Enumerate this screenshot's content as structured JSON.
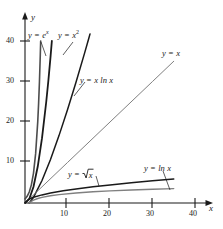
{
  "chart_data": {
    "type": "line",
    "title": "",
    "xlabel": "x",
    "ylabel": "y",
    "xlim": [
      0,
      43
    ],
    "ylim": [
      0,
      45
    ],
    "grid": false,
    "legend_position": "inline-annotations",
    "x_ticks": [
      10,
      20,
      30,
      40
    ],
    "y_ticks": [
      10,
      20,
      30,
      40
    ],
    "x_tick_labels": [
      "10",
      "20",
      "30",
      "40"
    ],
    "y_tick_labels": [
      "10",
      "20",
      "30",
      "40"
    ],
    "series": [
      {
        "name": "y = e^x",
        "label": "y = e",
        "label_sup": "x",
        "expression": "exp(x)",
        "color": "#4d4d4d",
        "width": 1.6,
        "x": [
          0,
          0.5,
          1,
          1.5,
          2,
          2.5,
          3,
          3.2,
          3.4,
          3.6,
          3.689
        ],
        "values": [
          1,
          1.65,
          2.72,
          4.48,
          7.39,
          12.18,
          20.09,
          24.53,
          29.96,
          36.6,
          40
        ]
      },
      {
        "name": "y = x^2",
        "label": "y = x",
        "label_sup": "2",
        "expression": "x*x",
        "color": "#1a1a1a",
        "width": 1.8,
        "x": [
          0,
          1,
          2,
          3,
          4,
          5,
          5.5,
          6,
          6.32
        ],
        "values": [
          0,
          1,
          4,
          9,
          16,
          25,
          30.25,
          36,
          40
        ]
      },
      {
        "name": "y = x ln x",
        "label": "y = x ln x",
        "expression": "x*ln(x)",
        "color": "#1a1a1a",
        "width": 1.5,
        "x": [
          1,
          2,
          4,
          6,
          8,
          10,
          12,
          14,
          15,
          15.3
        ],
        "values": [
          0,
          1.39,
          5.55,
          10.75,
          16.64,
          23.03,
          29.82,
          36.94,
          40.62,
          41.75
        ]
      },
      {
        "name": "y = x",
        "label": "y = x",
        "expression": "x",
        "color": "#808080",
        "width": 1.0,
        "x": [
          0,
          10,
          20,
          30,
          35
        ],
        "values": [
          0,
          10,
          20,
          30,
          35
        ]
      },
      {
        "name": "y = sqrt(x)",
        "label": "y = ",
        "label_radical": "x",
        "expression": "sqrt(x)",
        "color": "#1a1a1a",
        "width": 1.5,
        "x": [
          0,
          1,
          2,
          4,
          6,
          9,
          12,
          16,
          20,
          25,
          30,
          35
        ],
        "values": [
          0,
          1,
          1.41,
          2,
          2.45,
          3,
          3.46,
          4,
          4.47,
          5,
          5.48,
          5.92
        ]
      },
      {
        "name": "y = ln x",
        "label": "y = ln x",
        "expression": "ln(x)",
        "color": "#808080",
        "width": 1.4,
        "x": [
          1,
          1.5,
          2,
          3,
          4,
          6,
          8,
          12,
          16,
          20,
          25,
          30,
          35
        ],
        "values": [
          0,
          0.41,
          0.69,
          1.1,
          1.39,
          1.79,
          2.08,
          2.48,
          2.77,
          3.0,
          3.22,
          3.4,
          3.56
        ]
      }
    ],
    "annotations": [
      {
        "name": "label-exp",
        "text": "y = e^x",
        "x": 30,
        "y": 33,
        "leader": true
      },
      {
        "name": "label-xsq",
        "text": "y = x^2",
        "x": 59,
        "y": 33,
        "leader": true
      },
      {
        "name": "label-xlnx",
        "text": "y = x ln x",
        "x": 81,
        "y": 79,
        "leader": true
      },
      {
        "name": "label-x",
        "text": "y = x",
        "x": 163,
        "y": 52,
        "leader": false
      },
      {
        "name": "label-sqrt",
        "text": "y = sqrt(x)",
        "x": 69,
        "y": 172,
        "leader": true
      },
      {
        "name": "label-lnx",
        "text": "y = ln x",
        "x": 145,
        "y": 167,
        "leader": true
      }
    ]
  },
  "axes": {
    "x_axis_name": "x",
    "y_axis_name": "y"
  }
}
